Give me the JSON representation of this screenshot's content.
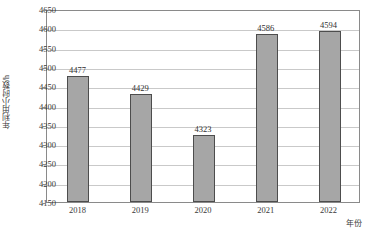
{
  "chart_data": {
    "type": "bar",
    "title": "",
    "subtitle": "",
    "xlabel": "年份",
    "ylabel": "年利用小时数/h",
    "categories": [
      "2018",
      "2019",
      "2020",
      "2021",
      "2022"
    ],
    "values": [
      4477,
      4429,
      4323,
      4586,
      4594
    ],
    "value_labels": [
      "4477",
      "4429",
      "4323",
      "4586",
      "4594"
    ],
    "ylim": [
      4150,
      4650
    ],
    "ytick_step": 50,
    "ytick_labels": [
      "4650",
      "4600",
      "4550",
      "4500",
      "4450",
      "4400",
      "4350",
      "4300",
      "4250",
      "4200",
      "4150"
    ],
    "ytick_values": [
      4650,
      4600,
      4550,
      4500,
      4450,
      4400,
      4350,
      4300,
      4250,
      4200,
      4150
    ],
    "grid": true,
    "grid_orientation": "horizontal",
    "legend": false,
    "legend_position": "none",
    "bar_color": "#a6a6a6",
    "bar_edge_color": "#4d4d4d",
    "grid_color": "#c9c9c9",
    "axis_color": "#8a8a8a",
    "text_color": "#3a3a3a",
    "background": "#ffffff"
  }
}
